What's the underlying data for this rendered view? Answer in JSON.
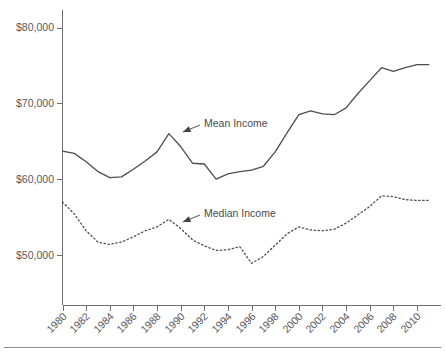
{
  "chart_data": {
    "type": "line",
    "title": "",
    "subtitle": "",
    "xlabel": "",
    "ylabel": "",
    "xlim": [
      1980,
      2011
    ],
    "ylim": [
      44000,
      82500
    ],
    "grid": false,
    "legend_position": "inline-annotations",
    "x_tick_labels": [
      "1980",
      "1982",
      "1984",
      "1986",
      "1988",
      "1990",
      "1992",
      "1994",
      "1996",
      "1998",
      "2000",
      "2002",
      "2004",
      "2006",
      "2008",
      "2010"
    ],
    "x_tick_values": [
      1980,
      1982,
      1984,
      1986,
      1988,
      1990,
      1992,
      1994,
      1996,
      1998,
      2000,
      2002,
      2004,
      2006,
      2008,
      2010
    ],
    "y_tick_labels": [
      "$80,000",
      "$70,000",
      "$60,000",
      "$50,000"
    ],
    "y_tick_values": [
      80000,
      70000,
      60000,
      50000
    ],
    "x": [
      1980,
      1981,
      1982,
      1983,
      1984,
      1985,
      1986,
      1987,
      1988,
      1989,
      1990,
      1991,
      1992,
      1993,
      1994,
      1995,
      1996,
      1997,
      1998,
      1999,
      2000,
      2001,
      2002,
      2003,
      2004,
      2005,
      2006,
      2007,
      2008,
      2009,
      2010,
      2011
    ],
    "series": [
      {
        "name": "Mean Income",
        "style": "solid",
        "color": "#4d4e50",
        "values": [
          63700,
          63400,
          62300,
          61000,
          60200,
          60300,
          61300,
          62400,
          63600,
          66000,
          64300,
          62100,
          62000,
          60000,
          60700,
          61000,
          61200,
          61700,
          63600,
          66100,
          68500,
          69000,
          68600,
          68500,
          69400,
          71300,
          73000,
          74700,
          74200,
          74700,
          75100,
          75100
        ]
      },
      {
        "name": "Median Income",
        "style": "dotted",
        "color": "#4d4e50",
        "values": [
          57000,
          55400,
          53200,
          51700,
          51400,
          51700,
          52400,
          53200,
          53700,
          54700,
          53500,
          52000,
          51200,
          50600,
          50700,
          51100,
          48900,
          49800,
          51300,
          52800,
          53700,
          53300,
          53200,
          53400,
          54200,
          55300,
          56400,
          57800,
          57700,
          57300,
          57200,
          57200
        ]
      }
    ],
    "annotations": [
      {
        "text": "Mean Income",
        "label_x": 204,
        "label_y": 127,
        "leader_from_x": 200,
        "leader_from_y": 125,
        "leader_to_x": 183,
        "leader_to_y": 132
      },
      {
        "text": "Median Income",
        "label_x": 204,
        "label_y": 217,
        "leader_from_x": 200,
        "leader_from_y": 215,
        "leader_to_x": 183,
        "leader_to_y": 222
      }
    ]
  },
  "colors": {
    "axis": "#6e6f71",
    "series": "#4d4e50",
    "text": "#58595b",
    "footer_rule": "#8b8c8e",
    "background": "#ffffff"
  }
}
